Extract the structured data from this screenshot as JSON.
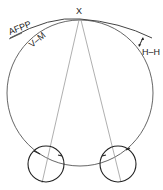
{
  "labels": {
    "apex": "X",
    "afpp": "AFPP",
    "vm": "V–M",
    "hh": "H–H"
  },
  "colors": {
    "stroke_dark": "#222222",
    "stroke_medium": "#555555",
    "stroke_light": "#9a9a9a"
  }
}
